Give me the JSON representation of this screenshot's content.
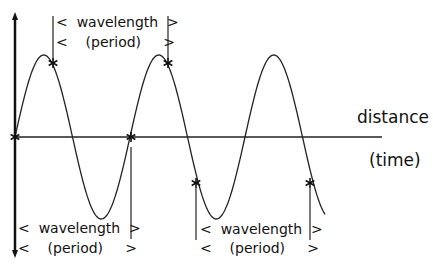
{
  "diagram": {
    "axis_labels": {
      "horizontal": "distance",
      "horizontal_alt": "(time)"
    },
    "brackets": [
      {
        "position": "top",
        "line1": "<  wavelength  >",
        "line2": "<    (period)     >",
        "marks": "crest-to-crest"
      },
      {
        "position": "bottom-left",
        "line1": "<  wavelength  >",
        "line2": "<    (period)     >",
        "marks": "zero-crossing-to-zero-crossing"
      },
      {
        "position": "bottom-right",
        "line1": "<  wavelength  >",
        "line2": "<    (period)     >",
        "marks": "descending-point-to-descending-point"
      }
    ],
    "wave": {
      "cycles_shown": 2.7,
      "markers": "asterisk"
    },
    "colors": {
      "line": "#222222",
      "axis": "#111111",
      "background": "#ffffff"
    }
  }
}
